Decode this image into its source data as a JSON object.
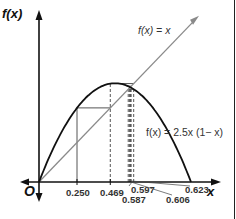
{
  "chart_data": {
    "type": "line",
    "title": "",
    "xlabel": "x",
    "ylabel": "f(x)",
    "origin_label": "O",
    "xlim": [
      0,
      1.05
    ],
    "ylim": [
      0,
      1.05
    ],
    "grid": false,
    "series": [
      {
        "name": "f(x) = x",
        "label": "f(x) = x",
        "kind": "identity",
        "color": "#8a8a8a"
      },
      {
        "name": "f(x) = 2.5x (1− x)",
        "label": "f(x) = 2.5x (1− x)",
        "kind": "logistic",
        "r": 2.5,
        "color": "#111111"
      }
    ],
    "cobweb": {
      "x0": 0.25,
      "iterates": [
        0.25,
        0.469,
        0.623,
        0.587,
        0.606,
        0.597,
        0.601,
        0.599,
        0.6
      ]
    },
    "x_tick_labels": [
      {
        "value": 0.25,
        "label": "0.250",
        "row": 1
      },
      {
        "value": 0.469,
        "label": "0.469",
        "row": 1
      },
      {
        "value": 0.597,
        "label": "0.597",
        "row": 1
      },
      {
        "value": 0.587,
        "label": "0.587",
        "row": 2
      },
      {
        "value": 0.606,
        "label": "0.606",
        "row": 2
      },
      {
        "value": 0.623,
        "label": "0.623",
        "row": 1
      }
    ],
    "colors": {
      "axis": "#111111",
      "identity": "#8a8a8a",
      "curve": "#111111",
      "cobweb": "#555555"
    }
  }
}
